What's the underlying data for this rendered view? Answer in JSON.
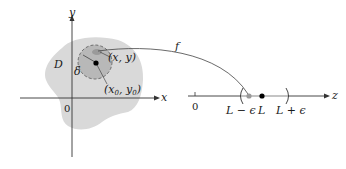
{
  "diagram": {
    "title": "",
    "left_plane": {
      "region_label": "D",
      "axis_x_label": "x",
      "axis_y_label": "y",
      "origin_label": "0",
      "point_label": "(x, y)",
      "center_label": "(x0, y0)",
      "center_label_main": "(x",
      "center_label_sub0": "0",
      "center_label_mid": ", y",
      "center_label_sub1": "0",
      "center_label_end": ")",
      "radius_label": "δ"
    },
    "mapping": {
      "function_label": "f"
    },
    "right_line": {
      "axis_label": "z",
      "origin_label": "0",
      "left_bound_label": "L − ϵ",
      "limit_label": "L",
      "right_bound_label": "L + ϵ"
    },
    "colors": {
      "region_fill": "#d9d9d9",
      "disk_fill": "#b8b8b8",
      "axis": "#333333",
      "point": "#000000",
      "image_point": "#9a9a9a",
      "interval": "#cfcfcf"
    }
  }
}
